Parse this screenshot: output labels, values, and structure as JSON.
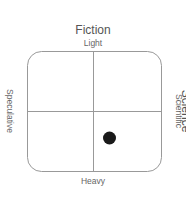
{
  "diagram": {
    "type": "quadrant",
    "title_top": "Fiction",
    "title_right": "Science",
    "axes": {
      "top": "Light",
      "bottom": "Heavy",
      "left": "Speculative",
      "right": "Scientific"
    },
    "marker": {
      "x_fraction": 0.62,
      "y_fraction": 0.72,
      "color": "#1a1a1a"
    },
    "colors": {
      "frame": "#999999",
      "text": "#555555"
    }
  }
}
